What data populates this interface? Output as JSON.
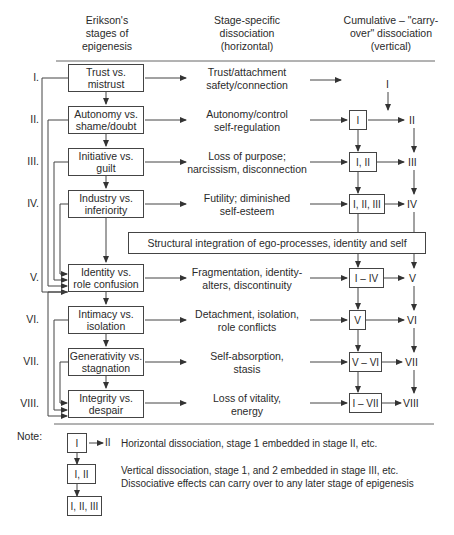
{
  "headers": {
    "col1": "Erikson's\nstages of\nepigenesis",
    "col2": "Stage-specific\ndissociation\n(horizontal)",
    "col3": "Cumulative – \"carry-\nover\" dissociation\n(vertical)"
  },
  "stages": [
    {
      "roman": "I.",
      "label": "Trust vs.\nmistrust",
      "dissociation": "Trust/attachment\nsafety/connection",
      "cumulative": "",
      "carry": "I"
    },
    {
      "roman": "II.",
      "label": "Autonomy vs.\nshame/doubt",
      "dissociation": "Autonomy/control\nself-regulation",
      "cumulative": "I",
      "carry": "II"
    },
    {
      "roman": "III.",
      "label": "Initiative vs.\nguilt",
      "dissociation": "Loss of purpose;\nnarcissism, disconnection",
      "cumulative": "I, II",
      "carry": "III"
    },
    {
      "roman": "IV.",
      "label": "Industry vs.\ninferiority",
      "dissociation": "Futility; diminished\nself-esteem",
      "cumulative": "I, II, III",
      "carry": "IV"
    },
    {
      "roman": "V.",
      "label": "Identity vs.\nrole confusion",
      "dissociation": "Fragmentation, identity-\nalters, discontinuity",
      "cumulative": "I – IV",
      "carry": "V"
    },
    {
      "roman": "VI.",
      "label": "Intimacy vs.\nisolation",
      "dissociation": "Detachment, isolation,\nrole conflicts",
      "cumulative": "V",
      "carry": "VI"
    },
    {
      "roman": "VII.",
      "label": "Generativity vs.\nstagnation",
      "dissociation": "Self-absorption,\nstasis",
      "cumulative": "V – VI",
      "carry": "VII"
    },
    {
      "roman": "VIII.",
      "label": "Integrity vs.\ndespair",
      "dissociation": "Loss of vitality,\nenergy",
      "cumulative": "I – VII",
      "carry": "VIII"
    }
  ],
  "integration": "Structural integration of ego-processes, identity and self",
  "note": {
    "label": "Note:",
    "box1": "I",
    "box1_arrow_to": "II",
    "box2": "I, II",
    "box3": "I, II, III",
    "text1": "Horizontal dissociation, stage 1 embedded in stage II, etc.",
    "text2": "Vertical dissociation, stage 1, and 2 embedded in stage III, etc.\nDissociative effects can carry over to any later stage of epigenesis"
  }
}
